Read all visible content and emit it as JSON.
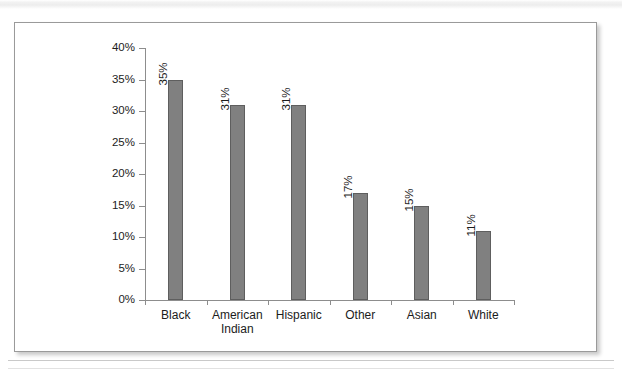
{
  "page": {
    "background_color": "#ffffff",
    "figure_border_color": "#9a9a9a"
  },
  "chart_data": {
    "type": "bar",
    "title": "",
    "subtitle": "",
    "xlabel": "",
    "ylabel": "",
    "categories": [
      "Black",
      "American Indian",
      "Hispanic",
      "Other",
      "Asian",
      "White"
    ],
    "values": [
      35,
      31,
      31,
      17,
      15,
      11
    ],
    "value_labels": [
      "35%",
      "31%",
      "31%",
      "17%",
      "15%",
      "11%"
    ],
    "ylim": [
      0,
      40
    ],
    "ytick_values": [
      0,
      5,
      10,
      15,
      20,
      25,
      30,
      35,
      40
    ],
    "ytick_labels": [
      "0%",
      "5%",
      "10%",
      "15%",
      "20%",
      "25%",
      "30%",
      "35%",
      "40%"
    ],
    "grid": false,
    "legend": null,
    "legend_position": "none",
    "bar_color": "#808080",
    "bar_edge_color": "#5e5e5e",
    "axis_color": "#8d8d8d",
    "value_label_rotation": 90,
    "annotations": []
  }
}
